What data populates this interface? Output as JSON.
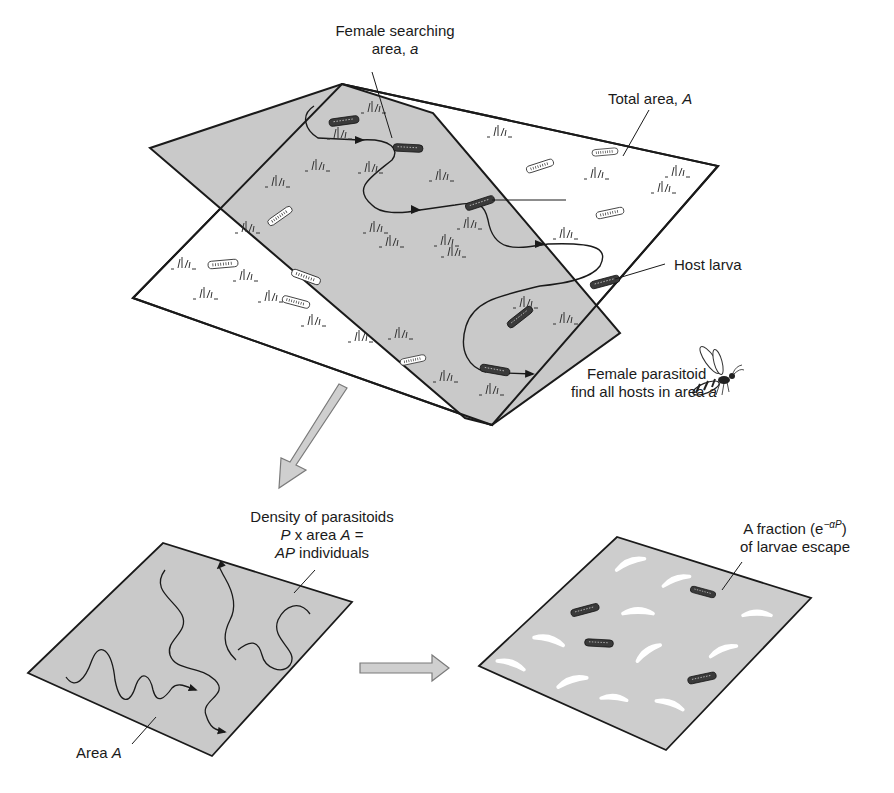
{
  "figure": {
    "colors": {
      "shaded_area": "#c9c9c9",
      "unshaded_area": "#ffffff",
      "outline": "#1a1a1a",
      "block_arrow_fill": "#cfcfcf",
      "block_arrow_stroke": "#7a7a7a",
      "larva_dark": "#3a3a3a",
      "larva_escaped_ghost": "#f4f4f4"
    },
    "top_panel": {
      "labels": {
        "female_searching_line1": "Female searching",
        "female_searching_line2_text": "area, ",
        "female_searching_line2_var": "a",
        "total_area_text": "Total area, ",
        "total_area_var": "A",
        "host_larva": "Host larva",
        "parasitoid_line1": "Female parasitoid",
        "parasitoid_line2_text": "find all hosts in area ",
        "parasitoid_line2_var": "a"
      },
      "icons": [
        "wasp-icon",
        "host-larva-icon",
        "grass-tuft-icon",
        "search-path-arrow-icon"
      ]
    },
    "bottom_left_panel": {
      "labels": {
        "density_line1": "Density of parasitoids",
        "density_line2_var1": "P",
        "density_line2_text": " x area ",
        "density_line2_var2": "A",
        "density_line2_eq": " =",
        "density_line3_var": "AP",
        "density_line3_text": " individuals",
        "area_text": "Area ",
        "area_var": "A"
      }
    },
    "bottom_right_panel": {
      "labels": {
        "fraction_line1_text": "A fraction (e",
        "fraction_line1_sup": "−αP",
        "fraction_line1_close": ")",
        "fraction_line2": "of larvae escape"
      }
    }
  }
}
